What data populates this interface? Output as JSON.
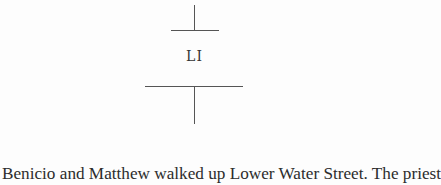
{
  "chapter": {
    "number": "LI"
  },
  "body": {
    "first_line": "Benicio and Matthew walked up Lower Water Street. The priest"
  }
}
